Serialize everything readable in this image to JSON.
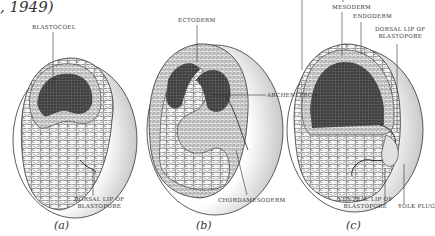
{
  "caption": ", 1949)",
  "panels": [
    {
      "id": "a",
      "letter": "(a)",
      "labels": {
        "blastocoel": "BLASTOCOEL",
        "dorsal_lip_1": "DORSAL LIP OF",
        "dorsal_lip_2": "BLASTOPORE"
      }
    },
    {
      "id": "b",
      "letter": "(b)",
      "labels": {
        "ectoderm": "ECTODERM",
        "archenteron": "ARCHENTERON",
        "chordamesoderm": "CHORDAMESODERM"
      }
    },
    {
      "id": "c",
      "letter": "(c)",
      "labels": {
        "mesoderm": "MESODERM",
        "endoderm": "ENDODERM",
        "dorsal_lip_1": "DORSAL LIP OF",
        "dorsal_lip_2": "BLASTOPORE",
        "archenteron": "ARCHENTERON",
        "ventral_lip_1": "VENTRAL LIP OF",
        "ventral_lip_2": "BLASTOPORE",
        "yolk_plug": "YOLK PLUG"
      }
    }
  ],
  "colors": {
    "line": "#333333",
    "dark_fill": "#3a3a3a",
    "cell_fill": "#f2f2f2",
    "shade": "#cfcfcf"
  }
}
